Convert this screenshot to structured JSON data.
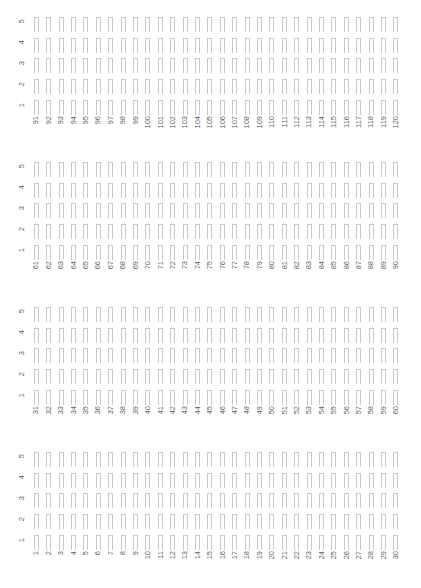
{
  "figure": {
    "kind": "empty-bar-grid-panels",
    "background_color": "#ffffff",
    "outline_color": "#c9c9c9",
    "label_color": "#5f5f5f",
    "label_rotation_degrees": 90,
    "rows_per_panel": 5,
    "columns_per_panel": 30,
    "panel_count": 4,
    "footnote": ""
  },
  "row_axis": {
    "labels": [
      "5",
      "4",
      "3",
      "2",
      "1"
    ]
  },
  "panels": [
    {
      "name": "panel-1",
      "row_labels": [
        "5",
        "4",
        "3",
        "2",
        "1"
      ],
      "column_labels": [
        "91",
        "92",
        "93",
        "94",
        "95",
        "96",
        "97",
        "98",
        "99",
        "100",
        "101",
        "102",
        "103",
        "104",
        "105",
        "106",
        "107",
        "108",
        "109",
        "110",
        "111",
        "112",
        "113",
        "114",
        "115",
        "116",
        "117",
        "118",
        "119",
        "120"
      ]
    },
    {
      "name": "panel-2",
      "row_labels": [
        "5",
        "4",
        "3",
        "2",
        "1"
      ],
      "column_labels": [
        "61",
        "62",
        "63",
        "64",
        "65",
        "66",
        "67",
        "68",
        "69",
        "70",
        "71",
        "72",
        "73",
        "74",
        "75",
        "76",
        "77",
        "78",
        "79",
        "80",
        "81",
        "82",
        "83",
        "84",
        "85",
        "86",
        "87",
        "88",
        "89",
        "90"
      ]
    },
    {
      "name": "panel-3",
      "row_labels": [
        "5",
        "4",
        "3",
        "2",
        "1"
      ],
      "column_labels": [
        "31",
        "32",
        "33",
        "34",
        "35",
        "36",
        "37",
        "38",
        "39",
        "40",
        "41",
        "42",
        "43",
        "44",
        "45",
        "46",
        "47",
        "48",
        "49",
        "50",
        "51",
        "52",
        "53",
        "54",
        "55",
        "56",
        "57",
        "58",
        "59",
        "60"
      ]
    },
    {
      "name": "panel-4",
      "row_labels": [
        "5",
        "4",
        "3",
        "2",
        "1"
      ],
      "column_labels": [
        "1",
        "2",
        "3",
        "4",
        "5",
        "6",
        "7",
        "8",
        "9",
        "10",
        "11",
        "12",
        "13",
        "14",
        "15",
        "16",
        "17",
        "18",
        "19",
        "20",
        "21",
        "22",
        "23",
        "24",
        "25",
        "26",
        "27",
        "28",
        "29",
        "30"
      ]
    }
  ],
  "chart_data": {
    "type": "bar",
    "title": "",
    "subtitle": "",
    "xlabel": "",
    "ylabel": "",
    "grid": false,
    "legend_position": "none",
    "panels": [
      {
        "panel": "panel-1",
        "categories": [
          "91",
          "92",
          "93",
          "94",
          "95",
          "96",
          "97",
          "98",
          "99",
          "100",
          "101",
          "102",
          "103",
          "104",
          "105",
          "106",
          "107",
          "108",
          "109",
          "110",
          "111",
          "112",
          "113",
          "114",
          "115",
          "116",
          "117",
          "118",
          "119",
          "120"
        ],
        "series": [
          {
            "name": "5",
            "values": [
              0,
              0,
              0,
              0,
              0,
              0,
              0,
              0,
              0,
              0,
              0,
              0,
              0,
              0,
              0,
              0,
              0,
              0,
              0,
              0,
              0,
              0,
              0,
              0,
              0,
              0,
              0,
              0,
              0,
              0
            ]
          },
          {
            "name": "4",
            "values": [
              0,
              0,
              0,
              0,
              0,
              0,
              0,
              0,
              0,
              0,
              0,
              0,
              0,
              0,
              0,
              0,
              0,
              0,
              0,
              0,
              0,
              0,
              0,
              0,
              0,
              0,
              0,
              0,
              0,
              0
            ]
          },
          {
            "name": "3",
            "values": [
              0,
              0,
              0,
              0,
              0,
              0,
              0,
              0,
              0,
              0,
              0,
              0,
              0,
              0,
              0,
              0,
              0,
              0,
              0,
              0,
              0,
              0,
              0,
              0,
              0,
              0,
              0,
              0,
              0,
              0
            ]
          },
          {
            "name": "2",
            "values": [
              0,
              0,
              0,
              0,
              0,
              0,
              0,
              0,
              0,
              0,
              0,
              0,
              0,
              0,
              0,
              0,
              0,
              0,
              0,
              0,
              0,
              0,
              0,
              0,
              0,
              0,
              0,
              0,
              0,
              0
            ]
          },
          {
            "name": "1",
            "values": [
              0,
              0,
              0,
              0,
              0,
              0,
              0,
              0,
              0,
              0,
              0,
              0,
              0,
              0,
              0,
              0,
              0,
              0,
              0,
              0,
              0,
              0,
              0,
              0,
              0,
              0,
              0,
              0,
              0,
              0
            ]
          }
        ]
      },
      {
        "panel": "panel-2",
        "categories": [
          "61",
          "62",
          "63",
          "64",
          "65",
          "66",
          "67",
          "68",
          "69",
          "70",
          "71",
          "72",
          "73",
          "74",
          "75",
          "76",
          "77",
          "78",
          "79",
          "80",
          "81",
          "82",
          "83",
          "84",
          "85",
          "86",
          "87",
          "88",
          "89",
          "90"
        ],
        "series": [
          {
            "name": "5",
            "values": [
              0,
              0,
              0,
              0,
              0,
              0,
              0,
              0,
              0,
              0,
              0,
              0,
              0,
              0,
              0,
              0,
              0,
              0,
              0,
              0,
              0,
              0,
              0,
              0,
              0,
              0,
              0,
              0,
              0,
              0
            ]
          },
          {
            "name": "4",
            "values": [
              0,
              0,
              0,
              0,
              0,
              0,
              0,
              0,
              0,
              0,
              0,
              0,
              0,
              0,
              0,
              0,
              0,
              0,
              0,
              0,
              0,
              0,
              0,
              0,
              0,
              0,
              0,
              0,
              0,
              0
            ]
          },
          {
            "name": "3",
            "values": [
              0,
              0,
              0,
              0,
              0,
              0,
              0,
              0,
              0,
              0,
              0,
              0,
              0,
              0,
              0,
              0,
              0,
              0,
              0,
              0,
              0,
              0,
              0,
              0,
              0,
              0,
              0,
              0,
              0,
              0
            ]
          },
          {
            "name": "2",
            "values": [
              0,
              0,
              0,
              0,
              0,
              0,
              0,
              0,
              0,
              0,
              0,
              0,
              0,
              0,
              0,
              0,
              0,
              0,
              0,
              0,
              0,
              0,
              0,
              0,
              0,
              0,
              0,
              0,
              0,
              0
            ]
          },
          {
            "name": "1",
            "values": [
              0,
              0,
              0,
              0,
              0,
              0,
              0,
              0,
              0,
              0,
              0,
              0,
              0,
              0,
              0,
              0,
              0,
              0,
              0,
              0,
              0,
              0,
              0,
              0,
              0,
              0,
              0,
              0,
              0,
              0
            ]
          }
        ]
      },
      {
        "panel": "panel-3",
        "categories": [
          "31",
          "32",
          "33",
          "34",
          "35",
          "36",
          "37",
          "38",
          "39",
          "40",
          "41",
          "42",
          "43",
          "44",
          "45",
          "46",
          "47",
          "48",
          "49",
          "50",
          "51",
          "52",
          "53",
          "54",
          "55",
          "56",
          "57",
          "58",
          "59",
          "60"
        ],
        "series": [
          {
            "name": "5",
            "values": [
              0,
              0,
              0,
              0,
              0,
              0,
              0,
              0,
              0,
              0,
              0,
              0,
              0,
              0,
              0,
              0,
              0,
              0,
              0,
              0,
              0,
              0,
              0,
              0,
              0,
              0,
              0,
              0,
              0,
              0
            ]
          },
          {
            "name": "4",
            "values": [
              0,
              0,
              0,
              0,
              0,
              0,
              0,
              0,
              0,
              0,
              0,
              0,
              0,
              0,
              0,
              0,
              0,
              0,
              0,
              0,
              0,
              0,
              0,
              0,
              0,
              0,
              0,
              0,
              0,
              0
            ]
          },
          {
            "name": "3",
            "values": [
              0,
              0,
              0,
              0,
              0,
              0,
              0,
              0,
              0,
              0,
              0,
              0,
              0,
              0,
              0,
              0,
              0,
              0,
              0,
              0,
              0,
              0,
              0,
              0,
              0,
              0,
              0,
              0,
              0,
              0
            ]
          },
          {
            "name": "2",
            "values": [
              0,
              0,
              0,
              0,
              0,
              0,
              0,
              0,
              0,
              0,
              0,
              0,
              0,
              0,
              0,
              0,
              0,
              0,
              0,
              0,
              0,
              0,
              0,
              0,
              0,
              0,
              0,
              0,
              0,
              0
            ]
          },
          {
            "name": "1",
            "values": [
              0,
              0,
              0,
              0,
              0,
              0,
              0,
              0,
              0,
              0,
              0,
              0,
              0,
              0,
              0,
              0,
              0,
              0,
              0,
              0,
              0,
              0,
              0,
              0,
              0,
              0,
              0,
              0,
              0,
              0
            ]
          }
        ]
      },
      {
        "panel": "panel-4",
        "categories": [
          "1",
          "2",
          "3",
          "4",
          "5",
          "6",
          "7",
          "8",
          "9",
          "10",
          "11",
          "12",
          "13",
          "14",
          "15",
          "16",
          "17",
          "18",
          "19",
          "20",
          "21",
          "22",
          "23",
          "24",
          "25",
          "26",
          "27",
          "28",
          "29",
          "30"
        ],
        "series": [
          {
            "name": "5",
            "values": [
              0,
              0,
              0,
              0,
              0,
              0,
              0,
              0,
              0,
              0,
              0,
              0,
              0,
              0,
              0,
              0,
              0,
              0,
              0,
              0,
              0,
              0,
              0,
              0,
              0,
              0,
              0,
              0,
              0,
              0
            ]
          },
          {
            "name": "4",
            "values": [
              0,
              0,
              0,
              0,
              0,
              0,
              0,
              0,
              0,
              0,
              0,
              0,
              0,
              0,
              0,
              0,
              0,
              0,
              0,
              0,
              0,
              0,
              0,
              0,
              0,
              0,
              0,
              0,
              0,
              0
            ]
          },
          {
            "name": "3",
            "values": [
              0,
              0,
              0,
              0,
              0,
              0,
              0,
              0,
              0,
              0,
              0,
              0,
              0,
              0,
              0,
              0,
              0,
              0,
              0,
              0,
              0,
              0,
              0,
              0,
              0,
              0,
              0,
              0,
              0,
              0
            ]
          },
          {
            "name": "2",
            "values": [
              0,
              0,
              0,
              0,
              0,
              0,
              0,
              0,
              0,
              0,
              0,
              0,
              0,
              0,
              0,
              0,
              0,
              0,
              0,
              0,
              0,
              0,
              0,
              0,
              0,
              0,
              0,
              0,
              0,
              0
            ]
          },
          {
            "name": "1",
            "values": [
              0,
              0,
              0,
              0,
              0,
              0,
              0,
              0,
              0,
              0,
              0,
              0,
              0,
              0,
              0,
              0,
              0,
              0,
              0,
              0,
              0,
              0,
              0,
              0,
              0,
              0,
              0,
              0,
              0,
              0
            ]
          }
        ]
      }
    ]
  }
}
